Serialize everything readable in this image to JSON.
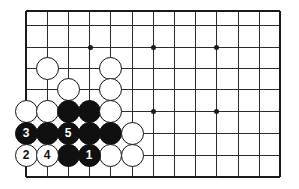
{
  "diagram": {
    "board": {
      "background_color": "#ffffff",
      "line_color": "#2b2b2b",
      "edge_color": "#1a1a1a",
      "grid": {
        "x_coords": [
          26,
          47,
          68,
          89,
          110,
          132,
          153,
          174,
          195,
          216,
          238,
          259,
          280
        ],
        "y_coords": [
          11,
          25,
          47,
          68,
          89,
          111,
          133,
          155,
          177
        ]
      },
      "star_points": [
        {
          "x": 90,
          "y": 47
        },
        {
          "x": 153,
          "y": 47
        },
        {
          "x": 216,
          "y": 47
        },
        {
          "x": 153,
          "y": 111
        },
        {
          "x": 216,
          "y": 111
        }
      ]
    },
    "stone_colors": {
      "black_fill": "#101010",
      "black_label": "#ffffff",
      "white_fill": "#ffffff",
      "white_label": "#121212",
      "outline": "#121212"
    },
    "stones": [
      {
        "color": "white",
        "x": 47,
        "y": 68,
        "label": ""
      },
      {
        "color": "white",
        "x": 110,
        "y": 68,
        "label": ""
      },
      {
        "color": "white",
        "x": 68,
        "y": 89,
        "label": ""
      },
      {
        "color": "white",
        "x": 110,
        "y": 89,
        "label": ""
      },
      {
        "color": "white",
        "x": 26,
        "y": 111,
        "label": ""
      },
      {
        "color": "white",
        "x": 47,
        "y": 111,
        "label": ""
      },
      {
        "color": "black",
        "x": 68,
        "y": 111,
        "label": ""
      },
      {
        "color": "black",
        "x": 89,
        "y": 111,
        "label": ""
      },
      {
        "color": "white",
        "x": 110,
        "y": 111,
        "label": ""
      },
      {
        "color": "black",
        "x": 26,
        "y": 133,
        "label": "3"
      },
      {
        "color": "black",
        "x": 47,
        "y": 133,
        "label": ""
      },
      {
        "color": "black",
        "x": 68,
        "y": 133,
        "label": "5"
      },
      {
        "color": "black",
        "x": 89,
        "y": 133,
        "label": ""
      },
      {
        "color": "black",
        "x": 110,
        "y": 133,
        "label": ""
      },
      {
        "color": "white",
        "x": 132,
        "y": 133,
        "label": ""
      },
      {
        "color": "white",
        "x": 26,
        "y": 155,
        "label": "2"
      },
      {
        "color": "white",
        "x": 47,
        "y": 155,
        "label": "4"
      },
      {
        "color": "black",
        "x": 68,
        "y": 155,
        "label": ""
      },
      {
        "color": "black",
        "x": 89,
        "y": 155,
        "label": "1"
      },
      {
        "color": "white",
        "x": 110,
        "y": 155,
        "label": ""
      },
      {
        "color": "white",
        "x": 132,
        "y": 155,
        "label": ""
      }
    ],
    "move_sequence": [
      {
        "number": "1",
        "color": "black"
      },
      {
        "number": "2",
        "color": "white"
      },
      {
        "number": "3",
        "color": "black"
      },
      {
        "number": "4",
        "color": "white"
      },
      {
        "number": "5",
        "color": "black"
      }
    ]
  }
}
